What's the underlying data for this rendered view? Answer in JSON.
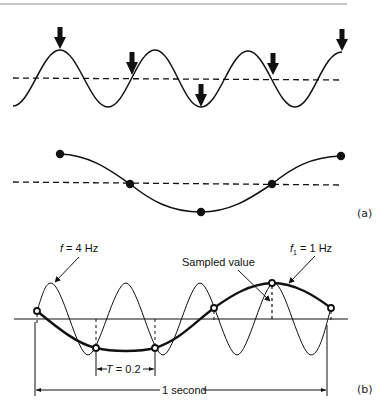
{
  "figure": {
    "panel_a_label": "(a)",
    "panel_b_label": "(b)",
    "labels": {
      "f_high": "f",
      "f_high_value": " = 4 Hz",
      "f_low": "f",
      "f_low_sub": "1",
      "f_low_value": " = 1 Hz",
      "sampled_value": "Sampled value",
      "period_T": "T",
      "period_value": " = 0.2",
      "one_second": "1 second"
    },
    "colors": {
      "ink": "#111111",
      "rule": "#8a8a8a",
      "background": "#ffffff"
    }
  },
  "diagram_data": {
    "panel_a_top": {
      "description": "Sinusoid sampled at arrow positions (sampling arrows)",
      "arrow_count": 5
    },
    "panel_a_bottom": {
      "description": "Reconstructed lower-frequency waveform through sample dots",
      "sample_count": 5
    },
    "panel_b": {
      "signal_frequency_hz": 4,
      "alias_frequency_hz": 1,
      "sampling_period_s": 0.2,
      "duration_s": 1,
      "sample_count": 6
    }
  }
}
